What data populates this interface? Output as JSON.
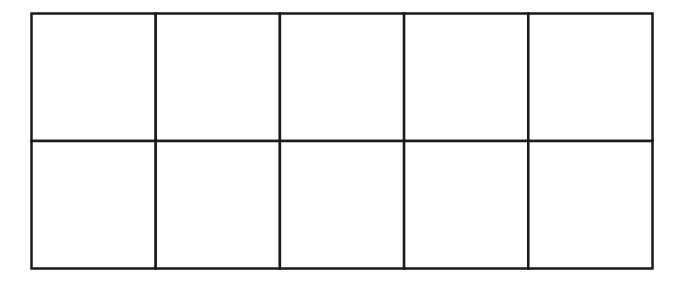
{
  "diagram": {
    "type": "ten-frame-grid",
    "rows": 2,
    "columns": 5,
    "cells": [
      {
        "row": 0,
        "col": 0,
        "label": ""
      },
      {
        "row": 0,
        "col": 1,
        "label": ""
      },
      {
        "row": 0,
        "col": 2,
        "label": ""
      },
      {
        "row": 0,
        "col": 3,
        "label": ""
      },
      {
        "row": 0,
        "col": 4,
        "label": ""
      },
      {
        "row": 1,
        "col": 0,
        "label": ""
      },
      {
        "row": 1,
        "col": 1,
        "label": ""
      },
      {
        "row": 1,
        "col": 2,
        "label": ""
      },
      {
        "row": 1,
        "col": 3,
        "label": ""
      },
      {
        "row": 1,
        "col": 4,
        "label": ""
      }
    ],
    "line_color": "#1a1a1a",
    "fill_color": "#ffffff"
  }
}
